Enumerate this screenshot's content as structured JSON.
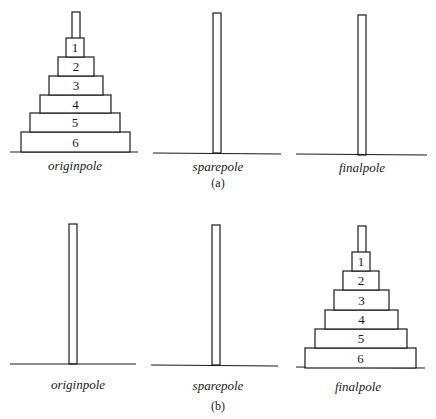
{
  "panels": [
    {
      "caption": "(a)",
      "poles": [
        {
          "label": "originpole",
          "disks": [
            "1",
            "2",
            "3",
            "4",
            "5",
            "6"
          ]
        },
        {
          "label": "sparepole",
          "disks": []
        },
        {
          "label": "finalpole",
          "disks": []
        }
      ]
    },
    {
      "caption": "(b)",
      "poles": [
        {
          "label": "originpole",
          "disks": []
        },
        {
          "label": "sparepole",
          "disks": []
        },
        {
          "label": "finalpole",
          "disks": [
            "1",
            "2",
            "3",
            "4",
            "5",
            "6"
          ]
        }
      ]
    }
  ]
}
